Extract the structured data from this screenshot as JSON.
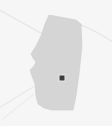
{
  "map": {
    "kind": "region-locator-thumbnail",
    "width": 112,
    "height": 126,
    "background_color": "#f6f6f6",
    "region": {
      "name": "Alberta",
      "fill_color": "#d5d5d5",
      "stroke_color": "#cccccc",
      "label": "",
      "polygon_points": "49,15 76,20 81,24 82,46 79,74 76,96 73,110 52,110 44,108 38,104 36,96 35,84 32,76 30,70 34,66 36,62 33,58 31,54 36,46 41,36 45,24"
    },
    "marker": {
      "name": "location-marker",
      "label": "",
      "color": "#3d3d3d",
      "x": 62,
      "y": 78,
      "size": 5
    },
    "reference_lines": [
      {
        "name": "graticule-upper-left",
        "path": "M -4 8 L 46 36",
        "color": "#e6e6e6",
        "width": 1.4
      },
      {
        "name": "graticule-upper-right",
        "path": "M 81 25 C 94 30 104 36 116 44",
        "color": "#e9e9e9",
        "width": 1.4
      },
      {
        "name": "graticule-lower-left",
        "path": "M -4 110 C 12 100 24 92 35 86",
        "color": "#e9e9e9",
        "width": 1.4
      },
      {
        "name": "graticule-lower-left-2",
        "path": "M 2 120 C 16 108 26 100 34 94",
        "color": "#ededed",
        "width": 1.2
      }
    ]
  }
}
